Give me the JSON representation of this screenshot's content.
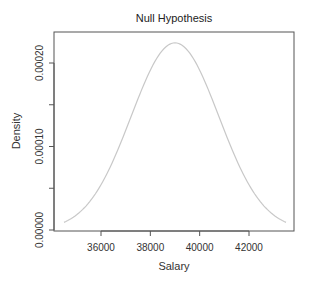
{
  "chart_data": {
    "type": "line",
    "title": "Null Hypothesis",
    "xlabel": "Salary",
    "ylabel": "Density",
    "xlim": [
      34200,
      43900
    ],
    "ylim": [
      0,
      0.000235
    ],
    "xticks": [
      36000,
      38000,
      40000,
      42000
    ],
    "xtick_labels": [
      "36000",
      "38000",
      "40000",
      "42000"
    ],
    "yticks": [
      0,
      5e-05,
      0.0001,
      0.00015,
      0.0002
    ],
    "ytick_labels": [
      "0.00000",
      "",
      "0.00010",
      "",
      "0.00020"
    ],
    "grid": false,
    "legend": null,
    "series": [
      {
        "name": "Normal density (null)",
        "color": "#c8c8c8",
        "distribution": {
          "mean": 39000,
          "sd": 1780
        },
        "x_range": [
          34500,
          43500
        ],
        "x": [
          34500,
          35000,
          35500,
          36000,
          36500,
          37000,
          37500,
          38000,
          38500,
          39000,
          39500,
          40000,
          40500,
          41000,
          41500,
          42000,
          42500,
          43000,
          43500
        ],
        "values": [
          9.3e-06,
          1.83e-05,
          3.31e-05,
          5.52e-05,
          8.39e-05,
          0.0001188,
          0.0001553,
          0.0001885,
          0.0002145,
          0.0002241,
          0.0002145,
          0.0001885,
          0.0001553,
          0.0001188,
          8.39e-05,
          5.52e-05,
          3.31e-05,
          1.83e-05,
          9.3e-06
        ]
      }
    ]
  }
}
